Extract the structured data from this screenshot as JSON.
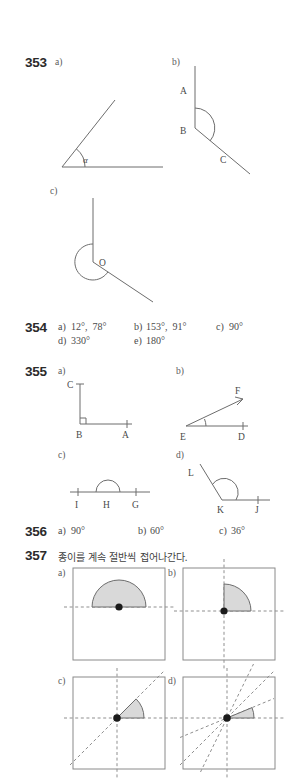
{
  "page": {
    "width": 286,
    "height": 780,
    "background": "#ffffff",
    "ink": "#4a4a4a",
    "accent_fill": "#d9d9d9"
  },
  "problems": [
    {
      "number": "353",
      "parts": [
        "a)",
        "b)",
        "c)"
      ],
      "figures": {
        "a": {
          "vertex_label": "α",
          "kind": "acute-angle-with-arc"
        },
        "b": {
          "points": [
            "A",
            "B",
            "C"
          ],
          "kind": "obtuse-angle-with-arc"
        },
        "c": {
          "points": [
            "O"
          ],
          "kind": "reflex-angle-with-arc"
        }
      }
    },
    {
      "number": "354",
      "answers_row1": [
        {
          "label": "a)",
          "value": "12°,  78°"
        },
        {
          "label": "b)",
          "value": "153°,  91°"
        },
        {
          "label": "c)",
          "value": "90°"
        }
      ],
      "answers_row2": [
        {
          "label": "d)",
          "value": "330°"
        },
        {
          "label": "e)",
          "value": "180°"
        }
      ]
    },
    {
      "number": "355",
      "parts": [
        "a)",
        "b)",
        "c)",
        "d)"
      ],
      "figures": {
        "a": {
          "points": [
            "C",
            "B",
            "A"
          ],
          "kind": "right-angle",
          "marker": "square"
        },
        "b": {
          "points": [
            "F",
            "E",
            "D"
          ],
          "kind": "acute-angle"
        },
        "c": {
          "points": [
            "I",
            "H",
            "G"
          ],
          "kind": "straight-angle"
        },
        "d": {
          "points": [
            "L",
            "K",
            "J"
          ],
          "kind": "obtuse-angle"
        }
      }
    },
    {
      "number": "356",
      "answers_row1": [
        {
          "label": "a)",
          "value": "90°"
        },
        {
          "label": "b)",
          "value": "60°"
        },
        {
          "label": "c)",
          "value": "36°"
        }
      ]
    },
    {
      "number": "357",
      "prompt": "종이를 계속 절반씩 접어나간다.",
      "parts": [
        "a)",
        "b)",
        "c)",
        "d)"
      ],
      "figures": {
        "a": {
          "sector_degrees": 180,
          "fold_lines": [
            "horizontal"
          ]
        },
        "b": {
          "sector_degrees": 90,
          "fold_lines": [
            "horizontal",
            "vertical"
          ]
        },
        "c": {
          "sector_degrees": 45,
          "fold_lines": [
            "horizontal",
            "vertical",
            "diagonal"
          ]
        },
        "d": {
          "sector_degrees": 22.5,
          "fold_lines": [
            "horizontal",
            "vertical",
            "diagonal",
            "diagonal-22.5",
            "diagonal-67.5"
          ]
        }
      }
    }
  ]
}
